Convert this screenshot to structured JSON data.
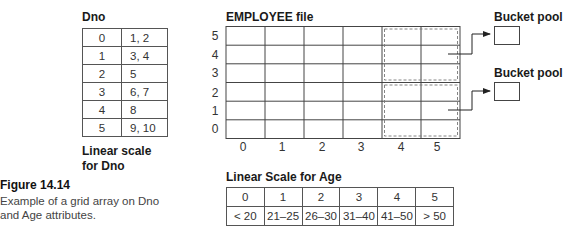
{
  "dno_table": {
    "header": "Dno",
    "rows": [
      {
        "index": "0",
        "values": "1, 2"
      },
      {
        "index": "1",
        "values": "3, 4"
      },
      {
        "index": "2",
        "values": "5"
      },
      {
        "index": "3",
        "values": "6, 7"
      },
      {
        "index": "4",
        "values": "8"
      },
      {
        "index": "5",
        "values": "9, 10"
      }
    ],
    "caption_line1": "Linear scale",
    "caption_line2": "for Dno"
  },
  "grid": {
    "title": "EMPLOYEE file",
    "row_labels": [
      "5",
      "4",
      "3",
      "2",
      "1",
      "0"
    ],
    "col_labels": [
      "0",
      "1",
      "2",
      "3",
      "4",
      "5"
    ]
  },
  "bucket_pools": [
    {
      "label": "Bucket pool"
    },
    {
      "label": "Bucket pool"
    }
  ],
  "age_table": {
    "title": "Linear Scale for Age",
    "indices": [
      "0",
      "1",
      "2",
      "3",
      "4",
      "5"
    ],
    "ranges": [
      "< 20",
      "21–25",
      "26–30",
      "31–40",
      "41–50",
      "> 50"
    ]
  },
  "figure": {
    "number": "Figure 14.14",
    "caption_line1": "Example of a grid array on Dno",
    "caption_line2": "and Age attributes."
  }
}
